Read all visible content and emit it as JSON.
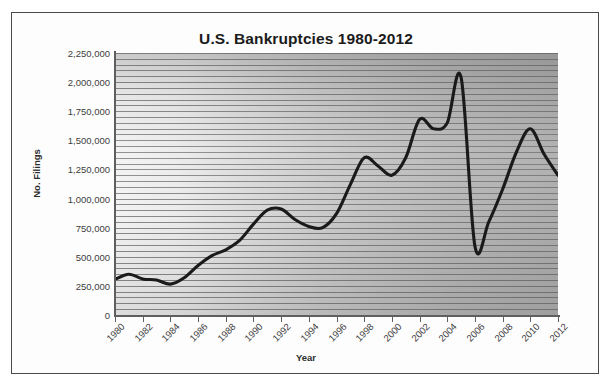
{
  "figure": {
    "frame_color": "#4a4a4a",
    "background_color": "#ffffff"
  },
  "chart_data": {
    "type": "line",
    "title": "U.S. Bankruptcies 1980-2012",
    "xlabel": "Year",
    "ylabel": "No. Filings",
    "grid": true,
    "legend": "none",
    "line_color": "#1a1a1a",
    "xlim": [
      1980,
      2012
    ],
    "ylim": [
      0,
      2250000
    ],
    "ytick_step": 250000,
    "ytick_labels": [
      "2,250,000",
      "2,000,000",
      "1,750,000",
      "1,500,000",
      "1,250,000",
      "1,000,000",
      "750,000",
      "500,000",
      "250,000",
      "0"
    ],
    "ytick_values": [
      2250000,
      2000000,
      1750000,
      1500000,
      1250000,
      1000000,
      750000,
      500000,
      250000,
      0
    ],
    "xtick_labels": [
      "1980",
      "1982",
      "1984",
      "1986",
      "1988",
      "1990",
      "1992",
      "1994",
      "1996",
      "1998",
      "2000",
      "2002",
      "2004",
      "2006",
      "2008",
      "2010",
      "2012"
    ],
    "xtick_values": [
      1980,
      1982,
      1984,
      1986,
      1988,
      1990,
      1992,
      1994,
      1996,
      1998,
      2000,
      2002,
      2004,
      2006,
      2008,
      2010,
      2012
    ],
    "x": [
      1980,
      1981,
      1982,
      1983,
      1984,
      1985,
      1986,
      1987,
      1988,
      1989,
      1990,
      1991,
      1992,
      1993,
      1994,
      1995,
      1996,
      1997,
      1998,
      1999,
      2000,
      2001,
      2002,
      2003,
      2004,
      2005,
      2006,
      2007,
      2008,
      2009,
      2010,
      2011,
      2012
    ],
    "values": [
      305000,
      350000,
      310000,
      300000,
      265000,
      320000,
      425000,
      510000,
      560000,
      640000,
      780000,
      900000,
      910000,
      820000,
      760000,
      750000,
      870000,
      1120000,
      1350000,
      1280000,
      1200000,
      1350000,
      1680000,
      1600000,
      1650000,
      2040000,
      590000,
      800000,
      1080000,
      1400000,
      1600000,
      1380000,
      1200000
    ],
    "series_name": "No. Filings"
  }
}
